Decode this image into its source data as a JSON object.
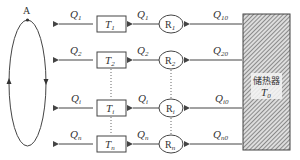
{
  "diagram": {
    "loop_point_label": "A",
    "storage": {
      "label": "储热器",
      "temp_symbol": "T",
      "temp_sub": "0"
    },
    "rows": [
      {
        "out_flow": "Q",
        "out_sub": "1",
        "tank": "T",
        "tank_sub": "1",
        "regulator": "R",
        "reg_sub": "1",
        "in_flow": "Q",
        "in_sub": "10"
      },
      {
        "out_flow": "Q",
        "out_sub": "2",
        "tank": "T",
        "tank_sub": "2",
        "regulator": "R",
        "reg_sub": "2",
        "in_flow": "Q",
        "in_sub": "20"
      },
      {
        "out_flow": "Q",
        "out_sub": "i",
        "tank": "T",
        "tank_sub": "i",
        "regulator": "R",
        "reg_sub": "i",
        "in_flow": "Q",
        "in_sub": "i0"
      },
      {
        "out_flow": "Q",
        "out_sub": "n",
        "tank": "T",
        "tank_sub": "n",
        "regulator": "R",
        "reg_sub": "n",
        "in_flow": "Q",
        "in_sub": "n0"
      }
    ],
    "colors": {
      "line": "#444444",
      "hatch": "#666666"
    }
  }
}
